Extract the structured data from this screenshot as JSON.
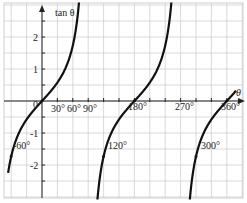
{
  "chart_data": {
    "type": "line",
    "title": "",
    "xlabel": "θ",
    "ylabel": "tan θ",
    "function": "tan(theta)",
    "x_range_deg": [
      -75,
      375
    ],
    "ylim": [
      -3.1,
      3.1
    ],
    "grid": true,
    "x_tick_labels": [
      "30°",
      "60°",
      "90°",
      "180°",
      "270°",
      "360°"
    ],
    "y_tick_labels": [
      "2",
      "1",
      "0",
      "-1",
      "-2"
    ],
    "point_labels": [
      "-60°",
      "120°",
      "300°"
    ],
    "asymptotes_deg": [
      90,
      270
    ],
    "series": [
      {
        "name": "tan θ branch 1",
        "x": [
          -60,
          -30,
          0,
          30,
          60,
          80
        ],
        "y": [
          -1.73,
          -0.58,
          0,
          0.58,
          1.73,
          5.67
        ]
      },
      {
        "name": "tan θ branch 2",
        "x": [
          100,
          120,
          150,
          180,
          210,
          240,
          260
        ],
        "y": [
          -5.67,
          -1.73,
          -0.58,
          0,
          0.58,
          1.73,
          5.67
        ]
      },
      {
        "name": "tan θ branch 3",
        "x": [
          280,
          300,
          330,
          360,
          375
        ],
        "y": [
          -5.67,
          -1.73,
          -0.58,
          0,
          0.27
        ]
      }
    ]
  },
  "labels": {
    "y_axis": "tan θ",
    "x_axis": "θ",
    "origin": "0",
    "x30": "30°",
    "x60": "60°",
    "x90": "90°",
    "x180": "180°",
    "x270": "270°",
    "x360": "360°",
    "y2": "2",
    "y1": "1",
    "ym1": "-1",
    "ym2": "-2",
    "p_m60": "-60°",
    "p120": "120°",
    "p300": "300°"
  },
  "colors": {
    "curve": "#111111",
    "grid": "#cfcfcf",
    "axis": "#222222"
  }
}
